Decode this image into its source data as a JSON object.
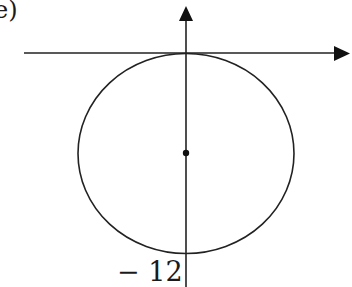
{
  "figure": {
    "part_label": "e)",
    "tick_label": "− 12",
    "colors": {
      "stroke": "#222222",
      "background": "#ffffff"
    },
    "elements": {
      "x_axis": "horizontal axis with arrow pointing right, tangent to top of circle",
      "y_axis": "vertical axis with arrow pointing up",
      "circle": "circle centered on y-axis, tangent to x-axis at origin",
      "center": "center point of circle",
      "tick": "label -12 at bottom of circle on y-axis"
    }
  }
}
